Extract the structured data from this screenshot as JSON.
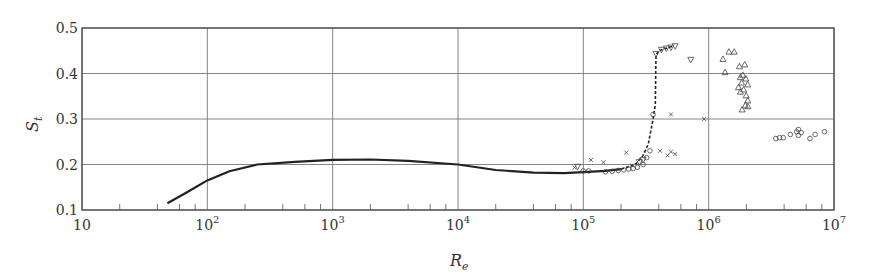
{
  "chart_data": {
    "type": "scatter",
    "title": "",
    "xlabel": "R",
    "xlabel_sub": "e",
    "ylabel": "S",
    "ylabel_sub": "t",
    "xscale": "log",
    "xlim": [
      10,
      10000000
    ],
    "ylim": [
      0.1,
      0.5
    ],
    "grid": true,
    "x_ticks": [
      {
        "value": 10,
        "base": "10",
        "exp": ""
      },
      {
        "value": 100,
        "base": "10",
        "exp": "2"
      },
      {
        "value": 1000,
        "base": "10",
        "exp": "3"
      },
      {
        "value": 10000,
        "base": "10",
        "exp": "4"
      },
      {
        "value": 100000,
        "base": "10",
        "exp": "5"
      },
      {
        "value": 1000000,
        "base": "10",
        "exp": "6"
      },
      {
        "value": 10000000,
        "base": "10",
        "exp": "7"
      }
    ],
    "y_ticks": [
      "0.1",
      "0.2",
      "0.3",
      "0.4",
      "0.5"
    ],
    "minor_x_ticks_per_decade": [
      2,
      4,
      6,
      8
    ],
    "series": [
      {
        "name": "mean curve",
        "kind": "line",
        "style": "solid",
        "x": [
          48,
          70,
          100,
          150,
          250,
          500,
          1000,
          2000,
          4000,
          10000,
          20000,
          40000,
          70000,
          100000,
          150000,
          200000
        ],
        "y": [
          0.115,
          0.14,
          0.165,
          0.185,
          0.2,
          0.206,
          0.21,
          0.211,
          0.208,
          0.2,
          0.188,
          0.182,
          0.181,
          0.183,
          0.186,
          0.19
        ]
      },
      {
        "name": "transition curve",
        "kind": "line",
        "style": "dashed",
        "x": [
          200000,
          260000,
          300000,
          330000,
          360000,
          370000,
          375000,
          380000,
          400000,
          450000,
          520000
        ],
        "y": [
          0.19,
          0.2,
          0.22,
          0.245,
          0.3,
          0.32,
          0.33,
          0.44,
          0.45,
          0.455,
          0.46
        ]
      },
      {
        "name": "circles (low)",
        "marker": "circle",
        "x": [
          100000,
          110000,
          150000,
          170000,
          190000,
          210000,
          230000,
          250000,
          270000,
          300000,
          320000,
          340000,
          360000
        ],
        "y": [
          0.186,
          0.186,
          0.184,
          0.185,
          0.187,
          0.188,
          0.19,
          0.191,
          0.194,
          0.2,
          0.215,
          0.23,
          0.31
        ]
      },
      {
        "name": "down-triangles",
        "marker": "triangle-down",
        "x": [
          90000,
          280000,
          300000,
          380000,
          420000,
          460000,
          500000,
          540000,
          720000
        ],
        "y": [
          0.195,
          0.205,
          0.21,
          0.443,
          0.452,
          0.455,
          0.457,
          0.46,
          0.43
        ]
      },
      {
        "name": "crosses",
        "marker": "x",
        "x": [
          85000,
          115000,
          145000,
          220000,
          245000,
          410000,
          470000,
          500000,
          540000,
          500000,
          920000
        ],
        "y": [
          0.193,
          0.21,
          0.205,
          0.226,
          0.198,
          0.23,
          0.22,
          0.228,
          0.223,
          0.31,
          0.3
        ]
      },
      {
        "name": "triangles",
        "marker": "triangle-up",
        "x": [
          1300000,
          1450000,
          1600000,
          1350000,
          1760000,
          1940000,
          1790000,
          1870000,
          1980000,
          1730000,
          1830000,
          1900000,
          2050000,
          1790000,
          1990000,
          2050000,
          1960000,
          1850000,
          2060000
        ],
        "y": [
          0.432,
          0.448,
          0.448,
          0.403,
          0.416,
          0.42,
          0.392,
          0.397,
          0.389,
          0.37,
          0.38,
          0.365,
          0.376,
          0.36,
          0.352,
          0.341,
          0.33,
          0.321,
          0.328
        ]
      },
      {
        "name": "circles (high)",
        "marker": "circle",
        "x": [
          3430000,
          3680000,
          3940000,
          4480000,
          5040000,
          5200000,
          5200000,
          5480000,
          6430000,
          7070000,
          8400000
        ],
        "y": [
          0.257,
          0.259,
          0.259,
          0.266,
          0.272,
          0.277,
          0.264,
          0.27,
          0.257,
          0.266,
          0.272
        ]
      }
    ]
  }
}
